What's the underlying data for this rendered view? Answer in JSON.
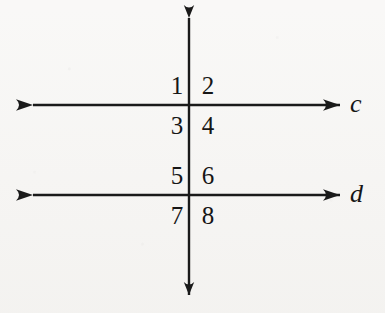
{
  "figure": {
    "background_color": "#f6f5f3",
    "ink_color": "#1a1a1a"
  },
  "lines": {
    "horizontal_top": {
      "name": "c",
      "label": "c",
      "y": 105,
      "x_start": 33,
      "x_end": 340,
      "arrows": "both"
    },
    "horizontal_bottom": {
      "name": "d",
      "label": "d",
      "y": 195,
      "x_start": 33,
      "x_end": 340,
      "arrows": "both"
    },
    "transversal": {
      "name": "transversal",
      "label": "",
      "x": 189,
      "y_start": 18,
      "y_end": 295,
      "arrows": "both"
    }
  },
  "intersections": [
    {
      "name": "upper",
      "x": 189,
      "y": 105
    },
    {
      "name": "lower",
      "x": 189,
      "y": 195
    }
  ],
  "angle_labels": [
    {
      "id": "1",
      "text": "1",
      "x": 166,
      "y": 73,
      "position": "upper-left-above-c"
    },
    {
      "id": "2",
      "text": "2",
      "x": 197,
      "y": 73,
      "position": "upper-right-above-c"
    },
    {
      "id": "3",
      "text": "3",
      "x": 166,
      "y": 113,
      "position": "upper-left-below-c"
    },
    {
      "id": "4",
      "text": "4",
      "x": 197,
      "y": 113,
      "position": "upper-right-below-c"
    },
    {
      "id": "5",
      "text": "5",
      "x": 166,
      "y": 163,
      "position": "lower-left-above-d"
    },
    {
      "id": "6",
      "text": "6",
      "x": 197,
      "y": 163,
      "position": "lower-right-above-d"
    },
    {
      "id": "7",
      "text": "7",
      "x": 166,
      "y": 203,
      "position": "lower-left-below-d"
    },
    {
      "id": "8",
      "text": "8",
      "x": 197,
      "y": 203,
      "position": "lower-right-below-d"
    }
  ],
  "line_labels": [
    {
      "id": "c",
      "text": "c",
      "x": 350,
      "y": 91
    },
    {
      "id": "d",
      "text": "d",
      "x": 350,
      "y": 181
    }
  ]
}
